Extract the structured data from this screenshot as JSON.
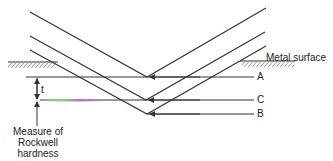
{
  "diagram": {
    "labels": {
      "metal_surface": "Metal surface",
      "a": "A",
      "b": "B",
      "c": "C",
      "t": "t",
      "measure_line1": "Measure of",
      "measure_line2": "Rockwell",
      "measure_line3": "hardness"
    },
    "colors": {
      "line": "#333333",
      "text": "#222222",
      "highlight_green": "#7fe07f",
      "highlight_magenta": "#c070c0"
    }
  }
}
